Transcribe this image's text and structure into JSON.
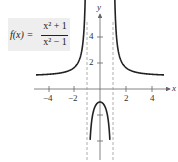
{
  "formula": {
    "lhs": "f(x) =",
    "numerator": "x² + 1",
    "denominator": "x² − 1"
  },
  "axes": {
    "x_label": "x",
    "y_label": "y",
    "x_ticks": [
      {
        "value": -4,
        "label": "−4"
      },
      {
        "value": -2,
        "label": "−2"
      },
      {
        "value": 2,
        "label": "2"
      },
      {
        "value": 4,
        "label": "4"
      }
    ],
    "y_ticks": [
      {
        "value": 4,
        "label": "4"
      },
      {
        "value": 2,
        "label": "2"
      },
      {
        "value": -2,
        "label": ""
      },
      {
        "value": -4,
        "label": ""
      }
    ]
  },
  "asymptotes": {
    "vertical": [
      -1,
      1
    ],
    "style": "dashed"
  },
  "colors": {
    "curve": "#222222",
    "axes": "#666666",
    "asymptote": "#999999",
    "formula_bg": "#eeeeee"
  }
}
